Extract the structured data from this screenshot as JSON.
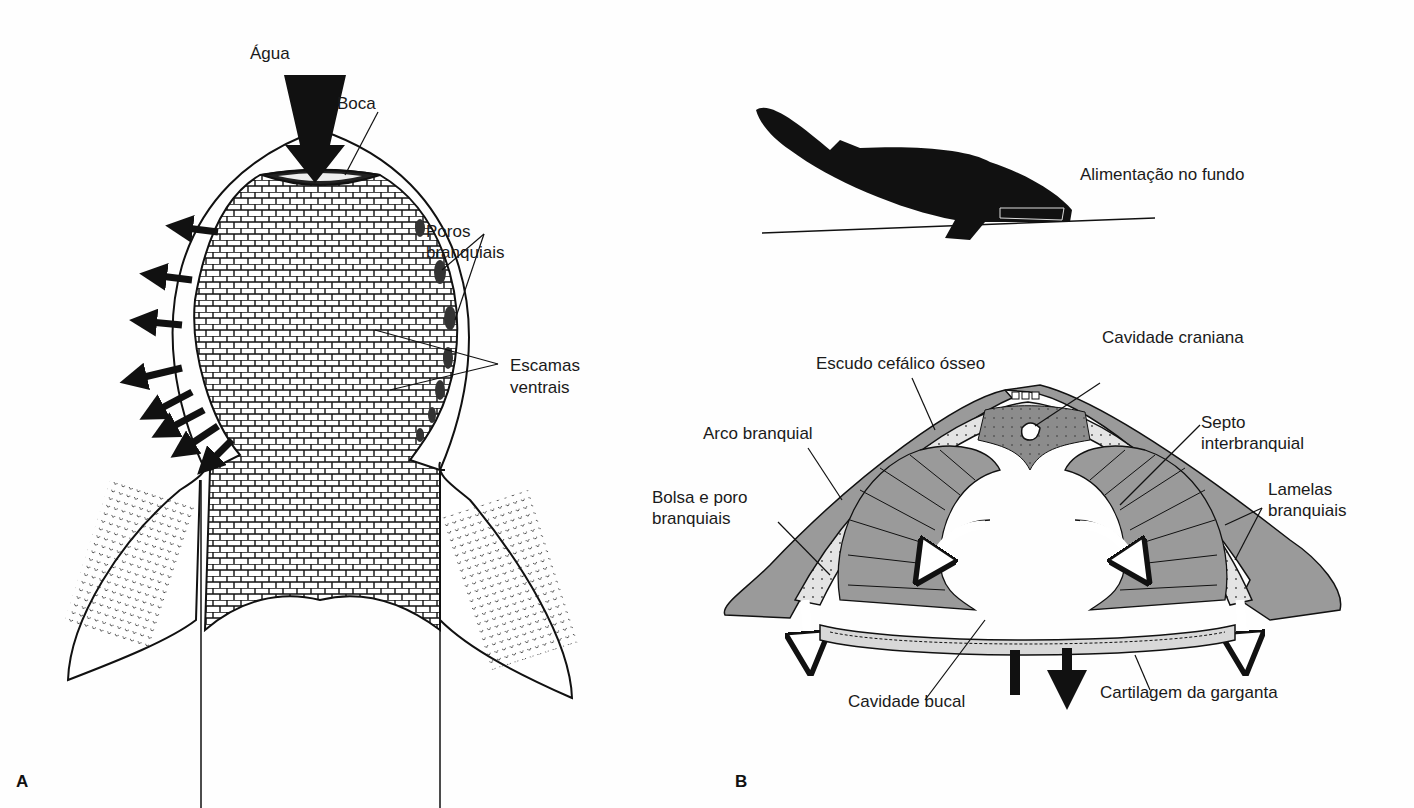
{
  "figure": {
    "panels": [
      {
        "id": "A",
        "letter": "A",
        "description": "Ventral view of head shield",
        "labels": {
          "water": "Água",
          "mouth": "Boca",
          "gill_pores_1": "Poros",
          "gill_pores_2": "branquiais",
          "ventral_scales_1": "Escamas",
          "ventral_scales_2": "ventrais"
        }
      },
      {
        "id": "B",
        "letter": "B",
        "description": "Bottom-feeding posture and cross-section through pharynx",
        "labels": {
          "bottom_feeding": "Alimentação no fundo",
          "cranial_cavity": "Cavidade craniana",
          "head_shield": "Escudo cefálico ósseo",
          "gill_arch": "Arco branquial",
          "interbranchial_septum_1": "Septo",
          "interbranchial_septum_2": "interbranquial",
          "gill_pouch_pore_1": "Bolsa e poro",
          "gill_pouch_pore_2": "branquiais",
          "gill_lamellae_1": "Lamelas",
          "gill_lamellae_2": "branquiais",
          "buccal_cavity": "Cavidade bucal",
          "throat_cartilage": "Cartilagem da garganta"
        }
      }
    ],
    "colors": {
      "ink": "#111111",
      "tissue_gray": "#9a9a9a",
      "light_gray": "#d8d8d8",
      "dark_stipple": "#7d7d7d",
      "paper": "#fefefe"
    }
  }
}
